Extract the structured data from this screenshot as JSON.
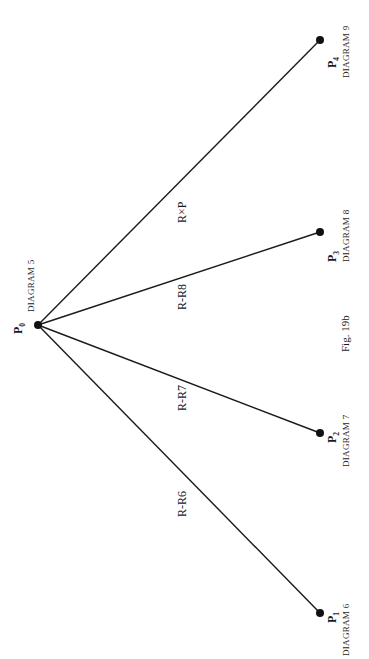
{
  "figure": {
    "caption": "Fig. 19b",
    "orientation": "rotated-90-ccw",
    "line_color": "#1a1a1a"
  },
  "nodes": [
    {
      "id": "P0",
      "label": "P",
      "subscript": "0",
      "diagram": "DIAGRAM 5",
      "x": 38,
      "y": 325
    },
    {
      "id": "P1",
      "label": "P",
      "subscript": "1",
      "diagram": "DIAGRAM 6",
      "x": 320,
      "y": 613
    },
    {
      "id": "P2",
      "label": "P",
      "subscript": "2",
      "diagram": "DIAGRAM 7",
      "x": 320,
      "y": 433
    },
    {
      "id": "P3",
      "label": "P",
      "subscript": "3",
      "diagram": "DIAGRAM 8",
      "x": 320,
      "y": 232
    },
    {
      "id": "P4",
      "label": "P",
      "subscript": "4",
      "diagram": "DIAGRAM 9",
      "x": 320,
      "y": 40
    }
  ],
  "edges": [
    {
      "from": "P0",
      "to": "P1",
      "label": "R-R6"
    },
    {
      "from": "P0",
      "to": "P2",
      "label": "R-R7"
    },
    {
      "from": "P0",
      "to": "P3",
      "label": "R-R8"
    },
    {
      "from": "P0",
      "to": "P4",
      "label": "R×P"
    }
  ]
}
